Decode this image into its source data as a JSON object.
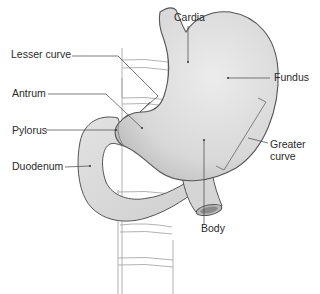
{
  "diagram": {
    "labels": {
      "cardia": "Cardia",
      "fundus": "Fundus",
      "lesser_curve": "Lesser curve",
      "antrum": "Antrum",
      "pylorus": "Pylorus",
      "duodenum": "Duodenum",
      "greater_curve_line1": "Greater",
      "greater_curve_line2": "curve",
      "body": "Body"
    },
    "colors": {
      "organ_fill": "#d9d9d9",
      "organ_stroke": "#555555",
      "spine_stroke": "#9a9a9a",
      "leader_line": "#444444",
      "text": "#2a2a2a"
    }
  }
}
